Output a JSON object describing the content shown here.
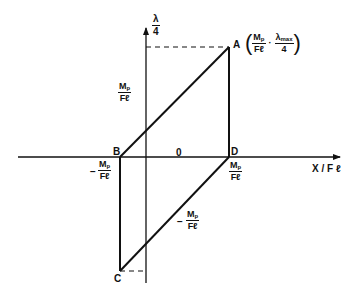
{
  "diagram": {
    "type": "hysteresis-parallelogram",
    "axes": {
      "x_label": "X / F ℓ",
      "y_label_num": "λ",
      "y_label_den": "4",
      "origin_label": "0"
    },
    "points": {
      "A": "A",
      "B": "B",
      "C": "C",
      "D": "D"
    },
    "point_A_coordinate": {
      "x_num": "M",
      "x_num_sub": "p",
      "x_den": "Fℓ",
      "separator": "·",
      "y_num": "λ",
      "y_num_sub": "max",
      "y_den": "4"
    },
    "axis_labels": {
      "y_intercept_pos": {
        "num": "M",
        "sub": "p",
        "den": "Fℓ"
      },
      "y_intercept_neg": {
        "sign": "−",
        "num": "M",
        "sub": "p",
        "den": "Fℓ"
      },
      "x_intercept_pos": {
        "num": "M",
        "sub": "p",
        "den": "Fℓ"
      },
      "x_intercept_neg": {
        "sign": "−",
        "num": "M",
        "sub": "p",
        "den": "Fℓ"
      }
    },
    "colors": {
      "line": "#111111",
      "background": "#ffffff"
    }
  }
}
